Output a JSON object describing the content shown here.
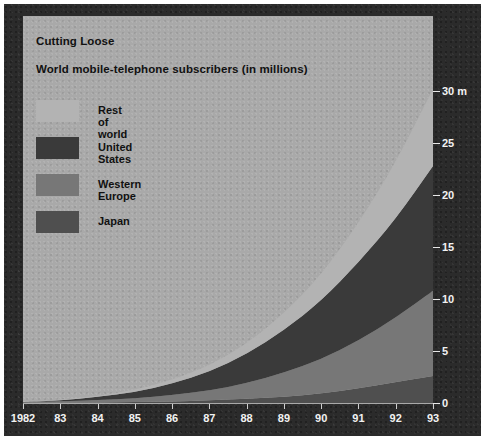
{
  "chart": {
    "title": "Cutting Loose",
    "subtitle": "World mobile-telephone subscribers (in millions)"
  },
  "legend": {
    "items": [
      {
        "label": "Rest of world",
        "color": "#b3b3b3"
      },
      {
        "label": "United States",
        "color": "#3a3a3a"
      },
      {
        "label": "Western Europe",
        "color": "#777777"
      },
      {
        "label": "Japan",
        "color": "#4f4f4f"
      }
    ]
  },
  "axes": {
    "y_ticks": [
      "0",
      "5",
      "10",
      "15",
      "20",
      "25",
      "30 m"
    ],
    "x_ticks": [
      "1982",
      "83",
      "84",
      "85",
      "86",
      "87",
      "88",
      "89",
      "90",
      "91",
      "92",
      "93"
    ]
  },
  "chart_data": {
    "type": "area",
    "title": "Cutting Loose",
    "subtitle": "World mobile-telephone subscribers (in millions)",
    "xlabel": "",
    "ylabel": "Subscribers (millions)",
    "ylim": [
      0,
      31
    ],
    "ytick_values": [
      0,
      5,
      10,
      15,
      20,
      25,
      30
    ],
    "ytick_labels": [
      "0",
      "5",
      "10",
      "15",
      "20",
      "25",
      "30 m"
    ],
    "grid": false,
    "legend_position": "top-left",
    "stacked": true,
    "stack_order_bottom_to_top": [
      "Japan",
      "Western Europe",
      "United States",
      "Rest of world"
    ],
    "categories": [
      1982,
      1983,
      1984,
      1985,
      1986,
      1987,
      1988,
      1989,
      1990,
      1991,
      1992,
      1993
    ],
    "series": [
      {
        "name": "Japan",
        "color": "#4f4f4f",
        "values": [
          0.02,
          0.04,
          0.06,
          0.09,
          0.15,
          0.25,
          0.4,
          0.6,
          0.9,
          1.4,
          2.0,
          2.6
        ]
      },
      {
        "name": "Western Europe",
        "color": "#777777",
        "values": [
          0.05,
          0.12,
          0.22,
          0.35,
          0.6,
          0.95,
          1.5,
          2.3,
          3.3,
          4.6,
          6.2,
          8.2
        ]
      },
      {
        "name": "United States",
        "color": "#3a3a3a",
        "values": [
          0.03,
          0.1,
          0.3,
          0.6,
          1.1,
          1.8,
          2.8,
          4.1,
          5.6,
          7.5,
          9.5,
          12.0
        ]
      },
      {
        "name": "Rest of world",
        "color": "#b3b3b3",
        "values": [
          0.02,
          0.05,
          0.1,
          0.2,
          0.35,
          0.6,
          1.0,
          1.6,
          2.5,
          3.8,
          5.4,
          7.4
        ]
      }
    ],
    "totals": [
      0.12,
      0.31,
      0.68,
      1.24,
      2.2,
      3.6,
      5.7,
      8.6,
      12.3,
      17.3,
      23.1,
      30.2
    ]
  }
}
